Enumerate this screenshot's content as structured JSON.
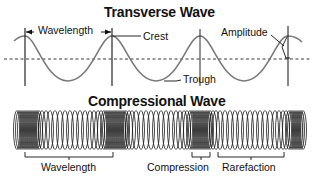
{
  "diagram": {
    "transverse": {
      "title": "Transverse Wave",
      "labels": {
        "wavelength": "Wavelength",
        "crest": "Crest",
        "trough": "Trough",
        "amplitude": "Amplitude"
      }
    },
    "compressional": {
      "title": "Compressional Wave",
      "labels": {
        "wavelength": "Wavelength",
        "compression": "Compression",
        "rarefaction": "Rarefaction"
      }
    },
    "colors": {
      "wave_line": "#777777",
      "ink": "#111111",
      "background": "#ffffff"
    }
  }
}
